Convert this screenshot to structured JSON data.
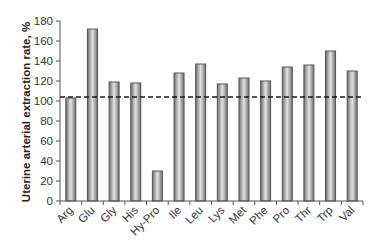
{
  "chart_data": {
    "type": "bar",
    "title": "",
    "xlabel": "",
    "ylabel": "Uterine arterial extraction rate, %",
    "ylim": [
      0,
      180
    ],
    "yticks": [
      0,
      20,
      40,
      60,
      80,
      100,
      120,
      140,
      160,
      180
    ],
    "grid": false,
    "legend": null,
    "categories": [
      "Arg",
      "Glu",
      "Gly",
      "His",
      "Hy-Pro",
      "Ile",
      "Leu",
      "Lys",
      "Met",
      "Phe",
      "Pro",
      "Thr",
      "Trp",
      "Val"
    ],
    "values": [
      103,
      172,
      119,
      118,
      30,
      128,
      137,
      117,
      123,
      120,
      134,
      136,
      150,
      130
    ],
    "reference_line": {
      "value": 104,
      "style": "dashed",
      "color": "#1a1a1a"
    },
    "bar_style": {
      "fill_center": "#e4e4e4",
      "fill_edge": "#6e6e6e",
      "outline": "#555555"
    }
  }
}
